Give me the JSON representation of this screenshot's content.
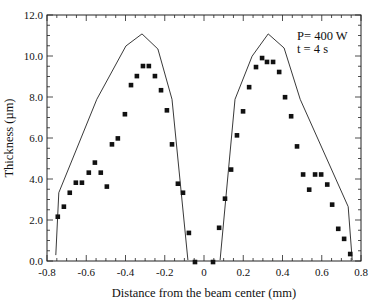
{
  "chart_data": {
    "type": "scatter",
    "title": "",
    "xlabel": "Distance from the beam center (mm)",
    "ylabel": "Thickness (µm)",
    "xlim": [
      -0.8,
      0.8
    ],
    "ylim": [
      0.0,
      12.0
    ],
    "xticks": [
      "-0.8",
      "-0.6",
      "-0.4",
      "-0.2",
      "0",
      "0.2",
      "0.4",
      "0.6",
      "0.8"
    ],
    "xtick_values": [
      -0.8,
      -0.6,
      -0.4,
      -0.2,
      0,
      0.2,
      0.4,
      0.6,
      0.8
    ],
    "yticks": [
      "0.0",
      "2.0",
      "4.0",
      "6.0",
      "8.0",
      "10.0",
      "12.0"
    ],
    "ytick_values": [
      0,
      2,
      4,
      6,
      8,
      10,
      12
    ],
    "grid": false,
    "annotations": [
      "P= 400 W",
      "t = 4 s"
    ],
    "series": [
      {
        "name": "Measured",
        "kind": "scatter",
        "marker": "square",
        "x": [
          -0.745,
          -0.714,
          -0.684,
          -0.653,
          -0.622,
          -0.587,
          -0.556,
          -0.526,
          -0.495,
          -0.469,
          -0.439,
          -0.403,
          -0.372,
          -0.342,
          -0.311,
          -0.281,
          -0.25,
          -0.219,
          -0.189,
          -0.163,
          -0.133,
          -0.107,
          -0.077,
          -0.046,
          0.046,
          0.077,
          0.107,
          0.138,
          0.168,
          0.199,
          0.23,
          0.265,
          0.296,
          0.321,
          0.352,
          0.383,
          0.413,
          0.444,
          0.474,
          0.505,
          0.536,
          0.566,
          0.597,
          0.628,
          0.653,
          0.684,
          0.714,
          0.745
        ],
        "y": [
          2.16,
          2.65,
          3.33,
          3.82,
          3.82,
          4.31,
          4.8,
          4.31,
          3.63,
          5.69,
          5.98,
          7.16,
          8.58,
          9.02,
          9.51,
          9.51,
          9.02,
          8.33,
          7.35,
          5.69,
          3.77,
          3.33,
          1.37,
          -0.05,
          -0.05,
          1.62,
          3.04,
          4.46,
          6.13,
          7.3,
          8.48,
          9.46,
          9.9,
          9.71,
          9.71,
          9.22,
          7.99,
          7.06,
          5.59,
          4.22,
          3.48,
          4.22,
          4.22,
          3.73,
          2.75,
          1.57,
          1.08,
          0.34
        ]
      },
      {
        "name": "Calculated",
        "kind": "line",
        "segments": [
          {
            "x": [
              -0.755,
              -0.74,
              -0.546,
              -0.398,
              -0.316,
              -0.235,
              -0.163,
              -0.082
            ],
            "y": [
              0.29,
              3.33,
              7.89,
              10.49,
              11.08,
              10.34,
              7.89,
              0.05
            ]
          },
          {
            "x": [
              0.082,
              0.158,
              0.245,
              0.327,
              0.408,
              0.49,
              0.735,
              0.755
            ],
            "y": [
              0.05,
              7.89,
              9.99,
              11.08,
              10.39,
              7.89,
              2.65,
              0.05
            ]
          }
        ]
      }
    ]
  }
}
